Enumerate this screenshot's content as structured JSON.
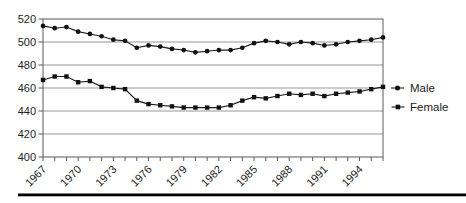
{
  "chart_data": {
    "type": "line",
    "title": "",
    "xlabel": "",
    "ylabel": "",
    "x": [
      1967,
      1968,
      1969,
      1970,
      1971,
      1972,
      1973,
      1974,
      1975,
      1976,
      1977,
      1978,
      1979,
      1980,
      1981,
      1982,
      1983,
      1984,
      1985,
      1986,
      1987,
      1988,
      1989,
      1990,
      1991,
      1992,
      1993,
      1994,
      1995,
      1996
    ],
    "x_tick_labels": [
      "1967",
      "1970",
      "1973",
      "1976",
      "1979",
      "1982",
      "1985",
      "1988",
      "1991",
      "1994"
    ],
    "x_tick_label_step": 3,
    "y_ticks": [
      400,
      420,
      440,
      460,
      480,
      500,
      520
    ],
    "ylim": [
      400,
      520
    ],
    "xlim": [
      1967,
      1996
    ],
    "grid": "horizontal",
    "legend_position": "right",
    "series": [
      {
        "name": "Male",
        "marker": "circle",
        "values": [
          514,
          512,
          513,
          509,
          507,
          505,
          502,
          501,
          495,
          497,
          496,
          494,
          493,
          491,
          492,
          493,
          493,
          495,
          499,
          501,
          500,
          498,
          500,
          499,
          497,
          498,
          500,
          501,
          502,
          504
        ]
      },
      {
        "name": "Female",
        "marker": "square",
        "values": [
          467,
          470,
          470,
          465,
          466,
          461,
          460,
          459,
          449,
          446,
          445,
          444,
          443,
          443,
          443,
          443,
          445,
          449,
          452,
          451,
          453,
          455,
          454,
          455,
          453,
          455,
          456,
          457,
          459,
          461
        ]
      }
    ]
  },
  "colors": {
    "line": "#1c1c1c",
    "marker": "#111111",
    "grid": "#8a8a8a",
    "border": "#5a5a5a",
    "axis_text": "#1c1c1c",
    "background": "#ffffff",
    "bottom_rule": "#000000"
  }
}
